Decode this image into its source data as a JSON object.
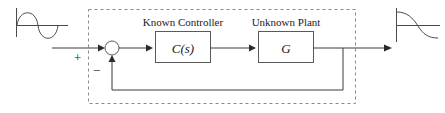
{
  "figure": {
    "kind": "control-system-block-diagram",
    "title": "",
    "background_color": "#ffffff",
    "line_color": "#3a3a3a",
    "box_stroke_color": "#5a5a5a",
    "dashed_boundary_color": "#8a8a8a"
  },
  "captions": {
    "controller": "Known Controller",
    "plant": "Unknown Plant"
  },
  "blocks": {
    "controller": {
      "label": "C(s)",
      "x": 155,
      "y": 31,
      "w": 55,
      "h": 31
    },
    "plant": {
      "label": "G",
      "x": 258,
      "y": 31,
      "w": 55,
      "h": 31
    }
  },
  "summing_junction": {
    "name": "summing-junction",
    "cx": 112,
    "cy": 48,
    "r": 7,
    "positive_sign": "+",
    "negative_sign": "−"
  },
  "signals": {
    "input_waveform": "sine-wave",
    "output_waveform": "decaying-exponential",
    "input_arrow_label": "",
    "output_arrow_label": ""
  },
  "paths": {
    "input_line_start_x": 52,
    "forward_line_y": 48,
    "feedback_line_y": 90,
    "feedback_tap_x": 343,
    "output_arrow_x": 392,
    "dashed_boundary": {
      "x": 88,
      "y": 9,
      "w": 267,
      "h": 94
    }
  }
}
